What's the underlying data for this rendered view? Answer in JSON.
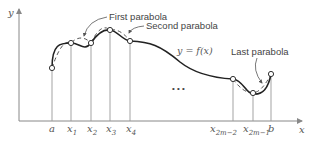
{
  "diagram": {
    "axes": {
      "x_label": "x",
      "y_label": "y"
    },
    "curve_label": "y = f(x)",
    "annotations": {
      "first": "First parabola",
      "second": "Second parabola",
      "last": "Last parabola"
    },
    "ellipsis": "• • •",
    "ticks": [
      {
        "id": "a",
        "main": "a",
        "sub": ""
      },
      {
        "id": "x1",
        "main": "x",
        "sub": "1"
      },
      {
        "id": "x2",
        "main": "x",
        "sub": "2"
      },
      {
        "id": "x3",
        "main": "x",
        "sub": "3"
      },
      {
        "id": "x4",
        "main": "x",
        "sub": "4"
      },
      {
        "id": "x2m-2",
        "main": "x",
        "sub": "2m−2"
      },
      {
        "id": "x2m-1",
        "main": "x",
        "sub": "2m−1"
      },
      {
        "id": "b",
        "main": "b",
        "sub": ""
      }
    ],
    "colors": {
      "curve": "#222222",
      "axis": "#888888",
      "dashed": "#555555",
      "text": "#555555"
    }
  }
}
